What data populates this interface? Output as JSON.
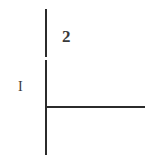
{
  "figure": {
    "background_color": "#ffffff",
    "stroke_color": "#2b2b2b",
    "label_color": "#3a3a3a",
    "width": 161,
    "height": 160,
    "labels": {
      "upper_segment": "2",
      "lower_segment": "I"
    },
    "elements": {
      "vertical_line_upper_name": "vertical-line-upper-segment",
      "vertical_line_lower_name": "vertical-line-lower-segment",
      "horizontal_line_name": "horizontal-line"
    }
  }
}
